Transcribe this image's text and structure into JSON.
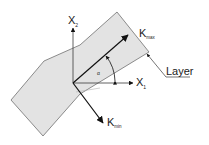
{
  "diagram": {
    "type": "layer-orientation-schematic",
    "colors": {
      "layer_fill": "#e3e3e3",
      "layer_stroke": "#707070",
      "axis": "#3a3a3a",
      "arrow": "#111111",
      "text": "#1a1a1a",
      "background": "#ffffff"
    },
    "labels": {
      "x1_main": "X",
      "x1_sub": "1",
      "x2_main": "X",
      "x2_sub": "2",
      "kmax_main": "K",
      "kmax_sub": "max",
      "kmin_main": "K",
      "kmin_sub": "min",
      "angle": "α",
      "layer": "Layer"
    }
  }
}
